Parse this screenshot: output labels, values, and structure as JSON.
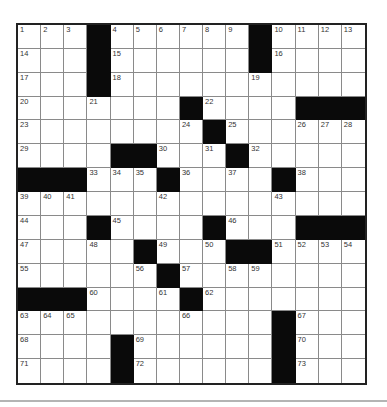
{
  "puzzle": {
    "rows": 15,
    "cols": 15,
    "grid": [
      [
        "1",
        "2",
        "3",
        "#",
        "4",
        "5",
        "6",
        "7",
        "8",
        "9",
        "#",
        "10",
        "11",
        "12",
        "13"
      ],
      [
        "14",
        "",
        "",
        "#",
        "15",
        "",
        "",
        "",
        "",
        "",
        "#",
        "16",
        "",
        "",
        ""
      ],
      [
        "17",
        "",
        "",
        "#",
        "18",
        "",
        "",
        "",
        "",
        "",
        "19",
        "",
        "",
        "",
        ""
      ],
      [
        "20",
        "",
        "",
        "21",
        "",
        "",
        "",
        "#",
        "22",
        "",
        "",
        "",
        "#",
        "#",
        "#"
      ],
      [
        "23",
        "",
        "",
        "",
        "",
        "",
        "",
        "24",
        "#",
        "25",
        "",
        "",
        "26",
        "27",
        "28"
      ],
      [
        "29",
        "",
        "",
        "",
        "#",
        "#",
        "30",
        "",
        "31",
        "#",
        "32",
        "",
        "",
        "",
        ""
      ],
      [
        "#",
        "#",
        "#",
        "33",
        "34",
        "35",
        "#",
        "36",
        "",
        "37",
        "",
        "#",
        "38",
        "",
        ""
      ],
      [
        "39",
        "40",
        "41",
        "",
        "",
        "",
        "42",
        "",
        "",
        "",
        "",
        "43",
        "",
        "",
        ""
      ],
      [
        "44",
        "",
        "",
        "#",
        "45",
        "",
        "",
        "",
        "#",
        "46",
        "",
        "",
        "#",
        "#",
        "#"
      ],
      [
        "47",
        "",
        "",
        "48",
        "",
        "#",
        "49",
        "",
        "50",
        "#",
        "#",
        "51",
        "52",
        "53",
        "54"
      ],
      [
        "55",
        "",
        "",
        "",
        "",
        "56",
        "#",
        "57",
        "",
        "58",
        "59",
        "",
        "",
        "",
        ""
      ],
      [
        "#",
        "#",
        "#",
        "60",
        "",
        "",
        "61",
        "#",
        "62",
        "",
        "",
        "",
        "",
        "",
        ""
      ],
      [
        "63",
        "64",
        "65",
        "",
        "",
        "",
        "",
        "66",
        "",
        "",
        "",
        "#",
        "67",
        "",
        ""
      ],
      [
        "68",
        "",
        "",
        "",
        "#",
        "69",
        "",
        "",
        "",
        "",
        "",
        "#",
        "70",
        "",
        ""
      ],
      [
        "71",
        "",
        "",
        "",
        "#",
        "72",
        "",
        "",
        "",
        "",
        "",
        "#",
        "73",
        "",
        ""
      ]
    ],
    "entries": [],
    "colors": {
      "block": "#0a0a0a",
      "cell": "#ffffff",
      "border": "#222222",
      "gridline": "#8a8a8a",
      "rule": "#b4b4b4"
    }
  }
}
